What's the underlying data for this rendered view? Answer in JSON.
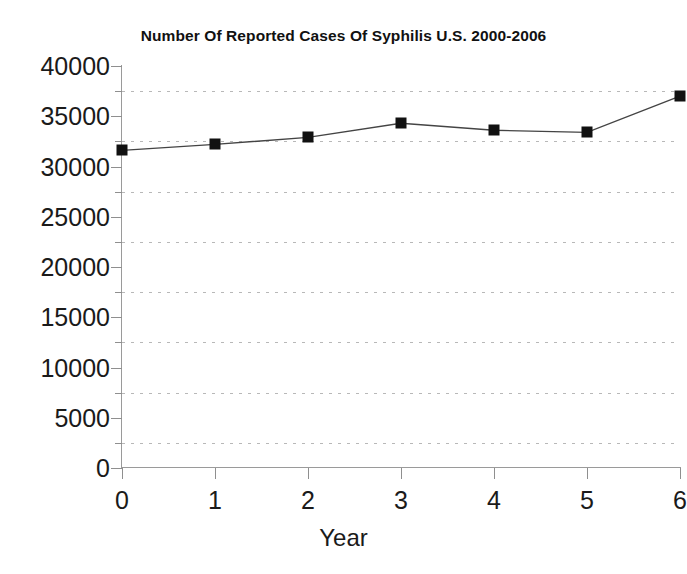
{
  "chart_data": {
    "type": "line",
    "title": "Number Of Reported Cases Of Syphilis U.S. 2000-2006",
    "xlabel": "Year",
    "ylabel": "",
    "x": [
      0,
      1,
      2,
      3,
      4,
      5,
      6
    ],
    "values": [
      31600,
      32200,
      32900,
      34300,
      33600,
      33400,
      37000
    ],
    "series": [
      {
        "name": "Reported cases of syphilis",
        "values": [
          31600,
          32200,
          32900,
          34300,
          33600,
          33400,
          37000
        ]
      }
    ],
    "xlim": [
      0,
      6
    ],
    "ylim": [
      0,
      40000
    ],
    "x_tick_labels": [
      "0",
      "1",
      "2",
      "3",
      "4",
      "5",
      "6"
    ],
    "y_tick_labels": [
      "0",
      "5000",
      "10000",
      "15000",
      "20000",
      "25000",
      "30000",
      "35000",
      "40000"
    ],
    "y_tick_values": [
      0,
      5000,
      10000,
      15000,
      20000,
      25000,
      30000,
      35000,
      40000
    ],
    "y_minor_tick_values": [
      2500,
      7500,
      12500,
      17500,
      22500,
      27500,
      32500,
      37500
    ],
    "gridlines": {
      "horizontal": true,
      "vertical": false,
      "style": "dotted",
      "at_values": [
        2500,
        7500,
        12500,
        17500,
        22500,
        27500,
        32500,
        37500
      ],
      "color": "#b8b8b8"
    },
    "legend": null,
    "marker": "square",
    "line_color": "#444444",
    "marker_color": "#111111",
    "background": "#ffffff"
  }
}
